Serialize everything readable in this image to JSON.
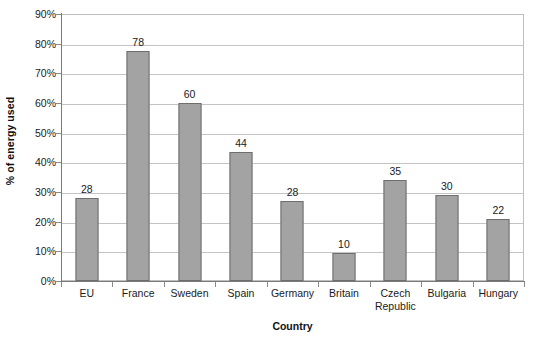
{
  "chart_data": {
    "type": "bar",
    "title": "",
    "subtitle": "",
    "xlabel": "Country",
    "ylabel": "% of energy used",
    "categories": [
      "EU",
      "France",
      "Sweden",
      "Spain",
      "Germany",
      "Britain",
      "Czech Republic",
      "Bulgaria",
      "Hungary"
    ],
    "values": [
      28,
      78,
      60,
      44,
      28,
      10,
      35,
      30,
      22
    ],
    "data_labels": [
      "28",
      "78",
      "60",
      "44",
      "28",
      "10",
      "35",
      "30",
      "22"
    ],
    "bar_plotted_percents": [
      28,
      77.5,
      60,
      43.5,
      27,
      9.5,
      34,
      29,
      21
    ],
    "ylim": [
      0,
      90
    ],
    "ytick_step": 10,
    "ytick_labels": [
      "0%",
      "10%",
      "20%",
      "30%",
      "40%",
      "50%",
      "60%",
      "70%",
      "80%",
      "90%"
    ],
    "ytick_values": [
      0,
      10,
      20,
      30,
      40,
      50,
      60,
      70,
      80,
      90
    ],
    "grid": true,
    "grid_axis": "y",
    "legend": false,
    "legend_position": "none",
    "bar_color": "#a3a3a3",
    "bar_border_color": "#6e6e6e",
    "gridline_color": "#c4c4c4",
    "axis_color": "#7a7a7a",
    "plot_background": "#ffffff"
  }
}
